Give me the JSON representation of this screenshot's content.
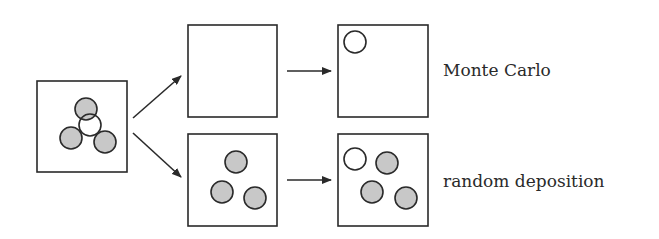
{
  "diagram": {
    "colors": {
      "stroke": "#2a2a2a",
      "filled_circle": "#c8c8c8",
      "empty_circle": "#ffffff",
      "background": "#ffffff"
    },
    "circle_radius": 11,
    "initial_box": {
      "x": 37,
      "y": 81,
      "w": 90,
      "h": 91,
      "circles": [
        {
          "cx": 86,
          "cy": 109,
          "filled": true
        },
        {
          "cx": 71,
          "cy": 138,
          "filled": true
        },
        {
          "cx": 105,
          "cy": 142,
          "filled": true
        },
        {
          "cx": 90,
          "cy": 125,
          "filled": false
        }
      ]
    },
    "branches": [
      {
        "label": "Monte Carlo",
        "label_pos": {
          "x": 443,
          "y": 62
        },
        "middle_box": {
          "x": 188,
          "y": 25,
          "w": 89,
          "h": 92,
          "circles": []
        },
        "final_box": {
          "x": 338,
          "y": 25,
          "w": 90,
          "h": 92,
          "circles": [
            {
              "cx": 355,
              "cy": 42,
              "filled": false
            }
          ]
        },
        "branch_arrow": {
          "x1": 133,
          "y1": 118,
          "x2": 181,
          "y2": 76
        },
        "step_arrow": {
          "x1": 287,
          "y1": 71,
          "x2": 331,
          "y2": 71
        }
      },
      {
        "label": "random deposition",
        "label_pos": {
          "x": 443,
          "y": 173
        },
        "middle_box": {
          "x": 188,
          "y": 134,
          "w": 89,
          "h": 92,
          "circles": [
            {
              "cx": 236,
              "cy": 162,
              "filled": true
            },
            {
              "cx": 222,
              "cy": 192,
              "filled": true
            },
            {
              "cx": 255,
              "cy": 198,
              "filled": true
            }
          ]
        },
        "final_box": {
          "x": 338,
          "y": 134,
          "w": 90,
          "h": 92,
          "circles": [
            {
              "cx": 355,
              "cy": 159,
              "filled": false
            },
            {
              "cx": 387,
              "cy": 163,
              "filled": true
            },
            {
              "cx": 372,
              "cy": 192,
              "filled": true
            },
            {
              "cx": 406,
              "cy": 198,
              "filled": true
            }
          ]
        },
        "branch_arrow": {
          "x1": 133,
          "y1": 133,
          "x2": 181,
          "y2": 177
        },
        "step_arrow": {
          "x1": 287,
          "y1": 180,
          "x2": 331,
          "y2": 180
        }
      }
    ]
  }
}
